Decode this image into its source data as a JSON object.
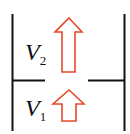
{
  "diagram": {
    "labels": {
      "upper": {
        "symbol": "V",
        "subscript": "2"
      },
      "lower": {
        "symbol": "V",
        "subscript": "1"
      }
    },
    "colors": {
      "walls": "#111111",
      "arrows": "#e8472a"
    }
  }
}
